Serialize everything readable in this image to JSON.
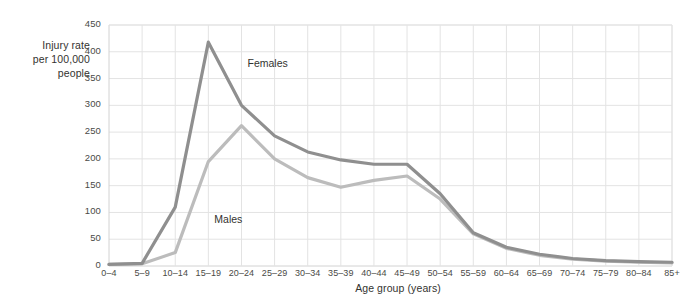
{
  "chart_data": {
    "type": "line",
    "title": "",
    "xlabel": "Age group (years)",
    "ylabel": "Injury rate per 100,000 people",
    "ylabel_lines": [
      "Injury rate",
      "per 100,000",
      "people"
    ],
    "categories": [
      "0–4",
      "5–9",
      "10–14",
      "15–19",
      "20–24",
      "25–29",
      "30–34",
      "35–39",
      "40–44",
      "45–49",
      "50–54",
      "55–59",
      "60–64",
      "65–69",
      "70–74",
      "75–79",
      "80–84",
      "85+"
    ],
    "yticks": [
      0,
      50,
      100,
      150,
      200,
      250,
      300,
      350,
      400,
      450
    ],
    "ylim": [
      0,
      450
    ],
    "grid": true,
    "legend_position": "inline-annotations",
    "series": [
      {
        "name": "Females",
        "color": "#8f8f8f",
        "annotation": "Females",
        "values": [
          3,
          5,
          110,
          418,
          300,
          243,
          213,
          198,
          190,
          190,
          135,
          62,
          35,
          22,
          14,
          10,
          8,
          7
        ]
      },
      {
        "name": "Males",
        "color": "#bcbcbc",
        "annotation": "Males",
        "values": [
          3,
          4,
          25,
          195,
          262,
          200,
          165,
          147,
          160,
          168,
          125,
          60,
          33,
          20,
          13,
          9,
          7,
          6
        ]
      }
    ],
    "annotations": [
      {
        "text": "Females",
        "x_index": 4,
        "value": 372
      },
      {
        "text": "Males",
        "x_index": 3,
        "value": 80
      }
    ],
    "colors": {
      "grid": "#e3e3e3",
      "axis": "#d2d2d2",
      "text": "#3b3b3b",
      "background": "#ffffff"
    }
  }
}
